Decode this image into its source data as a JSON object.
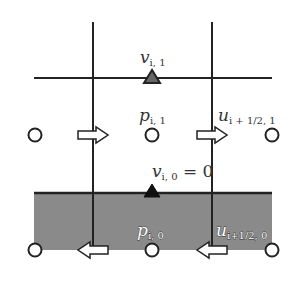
{
  "diagram": {
    "type": "staggered-grid-boundary",
    "colors": {
      "line": "#222222",
      "wall_fill": "#8a8a8a",
      "background": "#ffffff"
    },
    "labels": {
      "v_top": {
        "base": "v",
        "sub": "i, 1"
      },
      "p_top": {
        "base": "p",
        "sub": "i, 1"
      },
      "u_top": {
        "base": "u",
        "sub": "i + 1/2, 1"
      },
      "v_wall": {
        "base": "v",
        "sub": "i, 0",
        "suffix": " = 0"
      },
      "p_ghost": {
        "base": "p",
        "sub": "i, 0"
      },
      "u_ghost": {
        "base": "u",
        "sub": "i+1/2, 0"
      }
    },
    "nodes": {
      "pressure_row_1": [
        "circle",
        "circle",
        "circle"
      ],
      "velocity_u_row_1": [
        "arrow-right",
        "arrow-right"
      ],
      "pressure_row_0": [
        "circle",
        "circle",
        "circle"
      ],
      "velocity_u_row_0": [
        "arrow-left",
        "arrow-left"
      ],
      "v_markers": [
        "triangle-outline",
        "triangle-filled"
      ]
    }
  }
}
